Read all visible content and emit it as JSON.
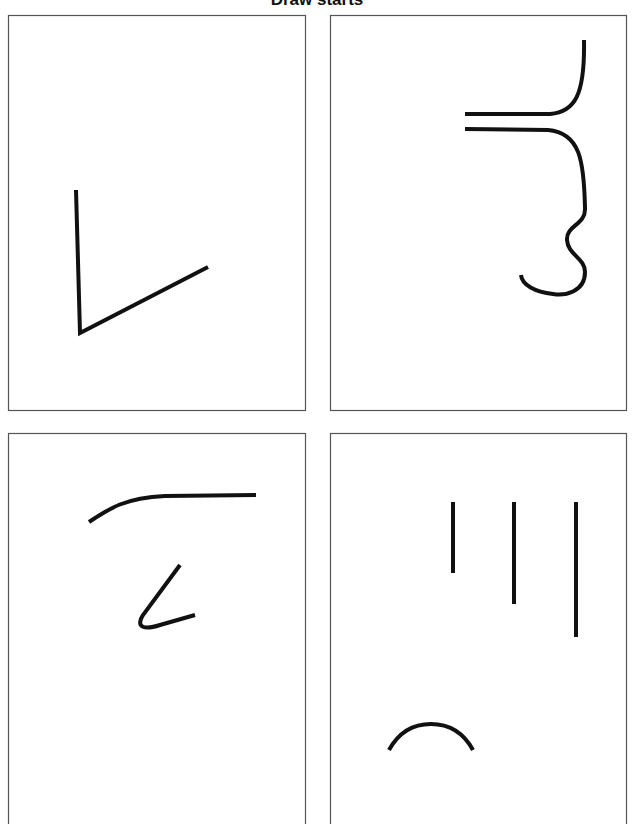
{
  "title": "Draw starts",
  "panels": [
    {
      "id": 1,
      "position": "top-left",
      "description": "Two straight strokes forming a V / check shape"
    },
    {
      "id": 2,
      "position": "top-right",
      "description": "Two parallel horizontal strokes, upper curving up, lower curving down into a squiggle and hook"
    },
    {
      "id": 3,
      "position": "bottom-left",
      "description": "Curved arc leading into horizontal line, and a hook stroke below"
    },
    {
      "id": 4,
      "position": "bottom-right",
      "description": "Three vertical lines of increasing length and a semicircular arc below"
    }
  ],
  "colors": {
    "stroke": "#111111",
    "border": "#555555",
    "background": "#ffffff"
  }
}
